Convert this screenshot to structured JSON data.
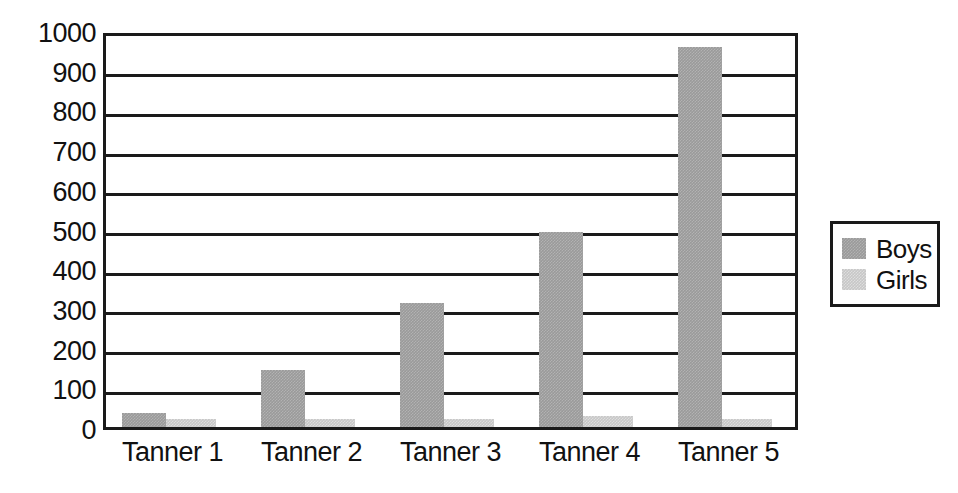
{
  "chart_data": {
    "type": "bar",
    "title": "",
    "subtitle": "",
    "xlabel": "",
    "ylabel": "",
    "categories": [
      "Tanner 1",
      "Tanner 2",
      "Tanner 3",
      "Tanner 4",
      "Tanner 5"
    ],
    "series": [
      {
        "name": "Boys",
        "color": "#9a9a9a",
        "values": [
          35,
          143,
          313,
          490,
          958
        ]
      },
      {
        "name": "Girls",
        "color": "#c7c7c7",
        "values": [
          20,
          20,
          20,
          28,
          20
        ]
      }
    ],
    "ylim": [
      0,
      1000
    ],
    "ytick_step": 100,
    "yticks": [
      "0",
      "100",
      "200",
      "300",
      "400",
      "500",
      "600",
      "700",
      "800",
      "900",
      "1000"
    ],
    "grid": true,
    "grid_axis": "y",
    "legend_position": "right",
    "annotations": []
  },
  "axes": {
    "y_tick_labels": [
      "1000",
      "900",
      "800",
      "700",
      "600",
      "500",
      "400",
      "300",
      "200",
      "100",
      "0"
    ],
    "x_tick_labels": [
      "Tanner 1",
      "Tanner 2",
      "Tanner 3",
      "Tanner 4",
      "Tanner 5"
    ]
  },
  "legend": {
    "entries": [
      {
        "label": "Boys",
        "color": "#9a9a9a"
      },
      {
        "label": "Girls",
        "color": "#c7c7c7"
      }
    ]
  },
  "colors": {
    "boys": "#9a9a9a",
    "girls": "#c7c7c7",
    "axis": "#1a1a1a",
    "background": "#ffffff",
    "text": "#111111"
  }
}
